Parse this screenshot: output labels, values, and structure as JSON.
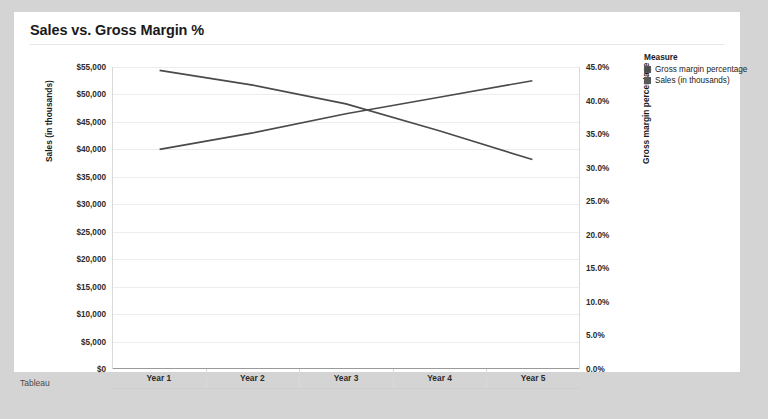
{
  "card": {
    "title": "Sales vs. Gross Margin %"
  },
  "caption": "Tableau",
  "legend": {
    "title": "Measure",
    "items": [
      {
        "label": "Gross margin percentage",
        "color": "#4d4d4d"
      },
      {
        "label": "Sales (in thousands)",
        "color": "#595959"
      }
    ]
  },
  "chart_data": {
    "type": "line",
    "title": "Sales vs. Gross Margin %",
    "xlabel": "",
    "categories": [
      "Year 1",
      "Year 2",
      "Year 3",
      "Year 4",
      "Year 5"
    ],
    "grid": true,
    "legend_position": "right",
    "axes": {
      "left": {
        "label": "Sales (in thousands)",
        "ylim": [
          0,
          55000
        ],
        "ticks": [
          "$0",
          "$5,000",
          "$10,000",
          "$15,000",
          "$20,000",
          "$25,000",
          "$30,000",
          "$35,000",
          "$40,000",
          "$45,000",
          "$50,000",
          "$55,000"
        ],
        "tick_values": [
          0,
          5000,
          10000,
          15000,
          20000,
          25000,
          30000,
          35000,
          40000,
          45000,
          50000,
          55000
        ]
      },
      "right": {
        "label": "Gross margin percentage",
        "ylim": [
          0,
          45
        ],
        "ticks": [
          "0.0%",
          "5.0%",
          "10.0%",
          "15.0%",
          "20.0%",
          "25.0%",
          "30.0%",
          "35.0%",
          "40.0%",
          "45.0%"
        ],
        "tick_values": [
          0,
          5,
          10,
          15,
          20,
          25,
          30,
          35,
          40,
          45
        ]
      }
    },
    "series": [
      {
        "name": "Sales (in thousands)",
        "axis": "left",
        "color": "#4a4a4a",
        "values": [
          40000,
          43000,
          46500,
          49500,
          52500
        ]
      },
      {
        "name": "Gross margin percentage",
        "axis": "right",
        "color": "#4a4a4a",
        "values": [
          44.5,
          42.3,
          39.5,
          35.5,
          31.2
        ]
      }
    ]
  }
}
